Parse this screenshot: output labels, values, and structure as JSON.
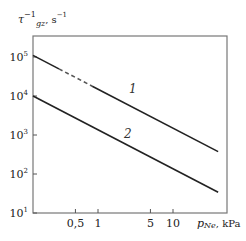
{
  "chart_data": {
    "type": "line",
    "title": "",
    "xlabel": "p_Ne, kPa",
    "ylabel": "τ_gz^-1, s^-1",
    "xscale": "log",
    "yscale": "log",
    "xlim": [
      0.136,
      52
    ],
    "ylim": [
      10,
      200000
    ],
    "grid": false,
    "x_ticks": [
      {
        "value": 0.5,
        "label": "0,5"
      },
      {
        "value": 1,
        "label": "1"
      },
      {
        "value": 5,
        "label": "5"
      },
      {
        "value": 10,
        "label": "10"
      }
    ],
    "y_ticks": [
      {
        "value": 10,
        "label": "10",
        "exp": "1"
      },
      {
        "value": 100,
        "label": "10",
        "exp": "2"
      },
      {
        "value": 1000,
        "label": "10",
        "exp": "3"
      },
      {
        "value": 10000,
        "label": "10",
        "exp": "4"
      },
      {
        "value": 100000,
        "label": "10",
        "exp": "5"
      }
    ],
    "series": [
      {
        "name": "1",
        "x": [
          0.136,
          0.3,
          1,
          10,
          40
        ],
        "values": [
          110000,
          50000,
          15000,
          1500,
          375
        ],
        "note": "dashed segment from ~0.24 to ~0.6 kPa"
      },
      {
        "name": "2",
        "x": [
          0.136,
          1,
          10,
          40
        ],
        "values": [
          10000,
          1350,
          135,
          34
        ]
      }
    ],
    "annotations": [
      {
        "text": "1",
        "near_series": "1"
      },
      {
        "text": "2",
        "near_series": "2"
      }
    ]
  },
  "labels": {
    "y_symbol": "τ",
    "y_sup": "−1",
    "y_sub": "gz",
    "y_unit": ", s",
    "y_unit_sup": "−1",
    "x_label": "p",
    "x_sub": "Ne",
    "x_unit": ", kPa",
    "curve1": "1",
    "curve2": "2"
  }
}
